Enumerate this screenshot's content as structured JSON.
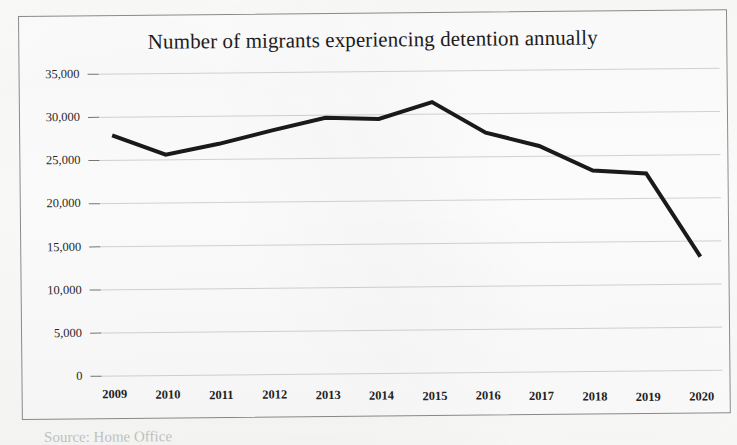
{
  "chart_data": {
    "type": "line",
    "title": "Number of migrants experiencing detention annually",
    "xlabel": "",
    "ylabel": "",
    "categories": [
      "2009",
      "2010",
      "2011",
      "2012",
      "2013",
      "2014",
      "2015",
      "2016",
      "2017",
      "2018",
      "2019",
      "2020"
    ],
    "values": [
      27900,
      25600,
      26800,
      28300,
      29700,
      29500,
      31400,
      27800,
      26200,
      23300,
      22900,
      13200
    ],
    "series": [
      {
        "name": "Migrants experiencing detention",
        "values": [
          27900,
          25600,
          26800,
          28300,
          29700,
          29500,
          31400,
          27800,
          26200,
          23300,
          22900,
          13200
        ]
      }
    ],
    "ylim": [
      0,
      35000
    ],
    "ytick_values": [
      0,
      5000,
      10000,
      15000,
      20000,
      25000,
      30000,
      35000
    ],
    "ytick_labels": [
      "0",
      "5,000",
      "10,000",
      "15,000",
      "20,000",
      "25,000",
      "30,000",
      "35,000"
    ],
    "grid": true,
    "grid_axis": "y",
    "legend": false,
    "legend_position": "none",
    "line_color": "#1a1a1a",
    "line_width": 4,
    "markers": false,
    "background_color": "#ffffff",
    "grid_color": "#c9c9c9",
    "border_color": "#8d8d8d"
  },
  "chart": {
    "title": "Number of migrants experiencing detention annually"
  },
  "caption": {
    "remnant_text": "Source: Home Office"
  }
}
